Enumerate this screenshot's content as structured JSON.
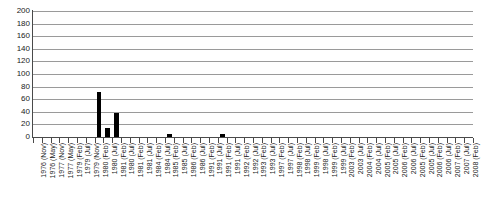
{
  "chart_data": {
    "type": "bar",
    "title": "",
    "subtitle": "",
    "xlabel": "",
    "ylabel": "",
    "ylim": [
      0,
      200
    ],
    "ytick_step": 20,
    "grid": true,
    "legend": null,
    "bar_color": "#000000",
    "grid_color": "#9a9a9a",
    "axis_color": "#4a4a4a",
    "yticks": [
      "0",
      "20",
      "40",
      "60",
      "80",
      "100",
      "120",
      "140",
      "160",
      "180",
      "200"
    ],
    "categories": [
      "1976 (Nov)",
      "1976 (May)",
      "1977 (Nov)",
      "1977 (May)",
      "1979 (Feb)",
      "1979 (Jul)",
      "1979 (Nov)",
      "1980 (Feb)",
      "1980 (Jul)",
      "1981 (Feb)",
      "1980 (Jul)",
      "1981 (Feb)",
      "1981 (Jul)",
      "1984 (Feb)",
      "1984 (Jul)",
      "1985 (Feb)",
      "1985 (Jul)",
      "1986 (Feb)",
      "1986 (Jul)",
      "1991 (Feb)",
      "1991 (Jul)",
      "1991 (Feb)",
      "1991 (Jul)",
      "1992 (Feb)",
      "1992 (Jul)",
      "1993 (Feb)",
      "1993 (Jul)",
      "1997 (Feb)",
      "1997 (Jul)",
      "1998 (Feb)",
      "1998 (Jul)",
      "1999 (Feb)",
      "1998 (Jul)",
      "1999 (Feb)",
      "1999 (Jul)",
      "2003 (Feb)",
      "2003 (Jul)",
      "2004 (Feb)",
      "2004 (Jul)",
      "2005 (Feb)",
      "2005 (Jul)",
      "2006 (Feb)",
      "2006 (Jul)",
      "2005 (Feb)",
      "2005 (Jul)",
      "2006 (Feb)",
      "2006 (Jul)",
      "2007 (Feb)",
      "2007 (Jul)",
      "2008 (Feb)"
    ],
    "values": [
      0,
      0,
      0,
      0,
      0,
      0,
      0,
      72,
      15,
      38,
      0,
      0,
      0,
      0,
      0,
      4,
      0,
      0,
      0,
      0,
      0,
      4,
      0,
      0,
      0,
      0,
      0,
      0,
      0,
      0,
      0,
      0,
      0,
      0,
      0,
      0,
      0,
      0,
      0,
      0,
      0,
      0,
      0,
      0,
      0,
      0,
      0,
      0,
      0,
      0
    ]
  }
}
